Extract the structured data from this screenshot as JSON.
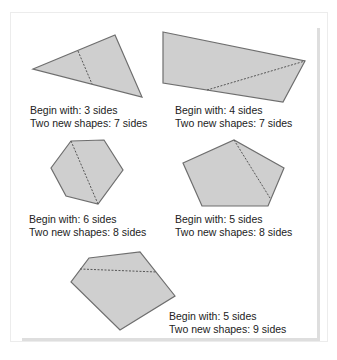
{
  "colors": {
    "shape_fill": "#cfcfcf",
    "shape_stroke": "#6e6e6e",
    "cut_line": "#555555",
    "text": "#222222"
  },
  "items": [
    {
      "shape": "triangle",
      "begin": "Begin with: 3 sides",
      "result": "Two new shapes: 7 sides"
    },
    {
      "shape": "quadrilateral",
      "begin": "Begin with: 4 sides",
      "result": "Two new shapes: 7 sides"
    },
    {
      "shape": "hexagon",
      "begin": "Begin with: 6 sides",
      "result": "Two new shapes: 8 sides"
    },
    {
      "shape": "pentagon",
      "begin": "Begin with: 5 sides",
      "result": "Two new shapes: 8 sides"
    },
    {
      "shape": "irregular-pentagon",
      "begin": "Begin with: 5 sides",
      "result": "Two new shapes: 9 sides"
    }
  ]
}
